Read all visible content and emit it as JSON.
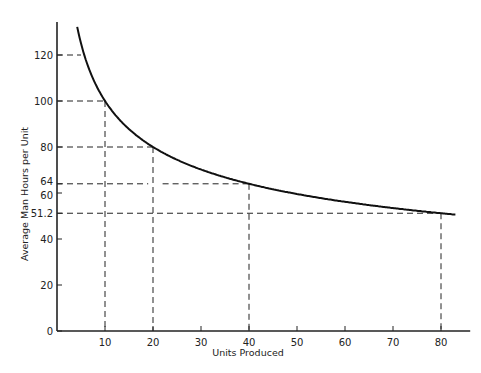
{
  "chart_data": {
    "type": "line",
    "title": "",
    "xlabel": "Units Produced",
    "ylabel": "Average Man Hours per Unit",
    "xlim": [
      0,
      84
    ],
    "ylim": [
      0,
      132
    ],
    "grid": false,
    "legend": null,
    "x_ticks": [
      10,
      20,
      30,
      40,
      50,
      60,
      70,
      80
    ],
    "y_ticks": [
      0,
      20,
      40,
      51.2,
      60,
      64,
      80,
      100,
      120
    ],
    "y_tick_labels": [
      "0",
      "20",
      "40",
      "51.2",
      "60",
      "64",
      "80",
      "100",
      "120"
    ],
    "series": [
      {
        "name": "Learning curve (80%)",
        "x": [
          4.2,
          5,
          6,
          8,
          10,
          12,
          15,
          20,
          25,
          30,
          40,
          50,
          60,
          70,
          80,
          83
        ],
        "y": [
          132,
          125.1,
          117.9,
          107.4,
          100,
          94.3,
          87.8,
          80,
          74.9,
          70.2,
          64,
          59.9,
          56.2,
          53.5,
          51.2,
          50.6
        ]
      }
    ],
    "reference_points": [
      {
        "x": 5,
        "y": 120
      },
      {
        "x": 10,
        "y": 100
      },
      {
        "x": 20,
        "y": 80
      },
      {
        "x": 40,
        "y": 64
      },
      {
        "x": 80,
        "y": 51.2
      }
    ],
    "annotations": "Dashed guide lines drop from each reference point to both axes"
  }
}
